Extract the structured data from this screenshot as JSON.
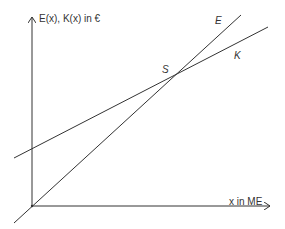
{
  "diagram": {
    "y_axis_label": "E(x), K(x) in €",
    "x_axis_label": "x in ME",
    "lines": [
      {
        "name": "E",
        "label": "E",
        "passes_origin": true
      },
      {
        "name": "K",
        "label": "K",
        "passes_origin": false
      }
    ],
    "intersection_label": "S",
    "colors": {
      "line": "#333333",
      "background": "#ffffff"
    }
  }
}
